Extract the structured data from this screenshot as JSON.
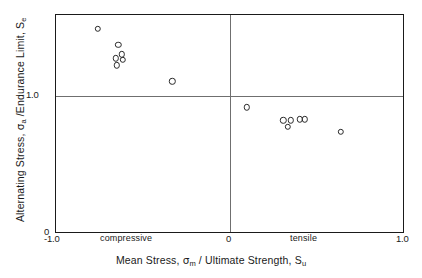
{
  "figure": {
    "background_color": "#ffffff",
    "foreground_color": "#1a1a1a",
    "gridline_color": "#6f6f6f",
    "marker_color": "#2a2a2a"
  },
  "axes": {
    "x_title_parts": {
      "prefix": "Mean Stress,  ",
      "symbol": "σ",
      "symbol_sub": "m",
      "middle": " / Ultimate Strength,  ",
      "denominator": "S",
      "denominator_sub": "u"
    },
    "y_title_parts": {
      "prefix": "Alternating Stress,  ",
      "symbol": "σ",
      "symbol_sub": "a",
      "middle": " /Endurance Limit,  ",
      "denominator": "S",
      "denominator_sub": "e"
    },
    "x_ticks": [
      "-1.0",
      "0",
      "1.0"
    ],
    "y_ticks": [
      "0",
      "1.0"
    ],
    "x_tick_neg1": "-1.0",
    "x_tick_0": "0",
    "x_tick_1": "1.0",
    "y_tick_0": "0",
    "y_tick_1": "1.0",
    "region_compressive": "compressive",
    "region_tensile": "tensile"
  },
  "chart_data": {
    "type": "scatter",
    "title": "",
    "xlabel": "Mean Stress, σm / Ultimate Strength, Su",
    "ylabel": "Alternating Stress, σa /Endurance Limit, Se",
    "xlim": [
      -1.0,
      1.0
    ],
    "ylim": [
      0.0,
      1.6
    ],
    "xticks": [
      -1.0,
      0.0,
      1.0
    ],
    "yticks": [
      0.0,
      1.0
    ],
    "grid": false,
    "reference_lines": [
      {
        "orientation": "horizontal",
        "value": 1.0
      },
      {
        "orientation": "vertical",
        "value": 0.0
      }
    ],
    "marker": "open-circle",
    "legend": null,
    "annotations": [
      {
        "text": "compressive",
        "x": -0.48,
        "y": -0.06
      },
      {
        "text": "tensile",
        "x": 0.35,
        "y": -0.06
      }
    ],
    "series": [
      {
        "name": "test data",
        "points": [
          {
            "x": -0.76,
            "y": 1.5
          },
          {
            "x": -0.64,
            "y": 1.38
          },
          {
            "x": -0.62,
            "y": 1.31
          },
          {
            "x": -0.655,
            "y": 1.28
          },
          {
            "x": -0.615,
            "y": 1.27
          },
          {
            "x": -0.65,
            "y": 1.23
          },
          {
            "x": -0.33,
            "y": 1.11
          },
          {
            "x": 0.1,
            "y": 0.92
          },
          {
            "x": 0.31,
            "y": 0.825
          },
          {
            "x": 0.355,
            "y": 0.825
          },
          {
            "x": 0.337,
            "y": 0.775
          },
          {
            "x": 0.405,
            "y": 0.83
          },
          {
            "x": 0.435,
            "y": 0.83
          },
          {
            "x": 0.64,
            "y": 0.74
          }
        ]
      }
    ]
  }
}
